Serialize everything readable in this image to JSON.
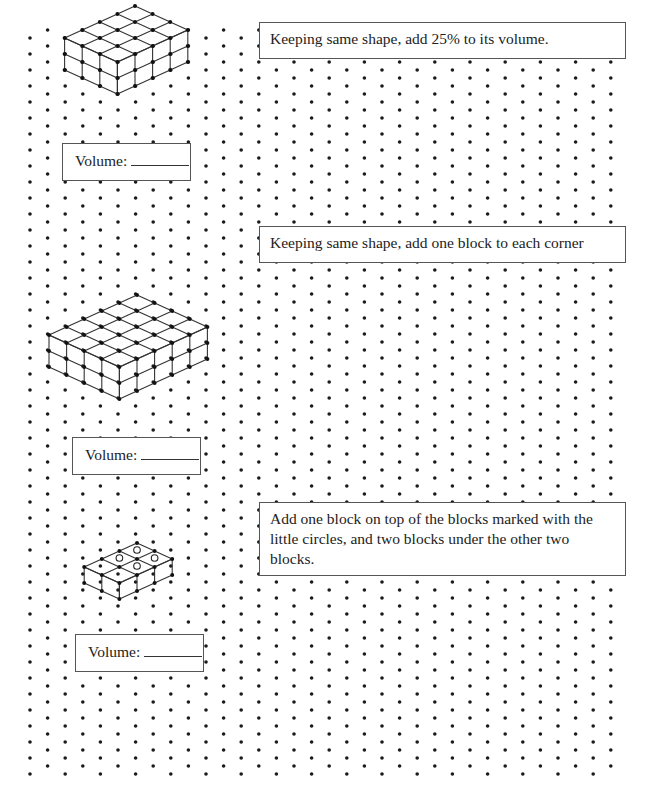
{
  "worksheet": {
    "instructions": [
      {
        "text": "Keeping same shape, add 25% to its volume."
      },
      {
        "text": "Keeping same shape, add one block to each corner"
      },
      {
        "text": "Add one block on top of the blocks marked with the little circles, and two blocks under the other two blocks."
      }
    ],
    "volume_boxes": [
      {
        "label": "Volume:",
        "value": ""
      },
      {
        "label": "Volume:",
        "value": ""
      },
      {
        "label": "Volume:",
        "value": ""
      }
    ],
    "figures": [
      {
        "name": "prism-3x4x2",
        "width": 3,
        "depth": 4,
        "height": 2
      },
      {
        "name": "prism-4x5x2",
        "width": 4,
        "depth": 5,
        "height": 2
      },
      {
        "name": "shape-2x3x1-with-circles",
        "width": 2,
        "depth": 3,
        "height": 1,
        "circle_markers": 4
      }
    ]
  },
  "grid": {
    "type": "isometric-dot",
    "x0": 30,
    "dx": 17.6,
    "y0": 38,
    "dy": 16,
    "cols": 34,
    "rows": 48,
    "dot_color": "#1a1a1a"
  }
}
